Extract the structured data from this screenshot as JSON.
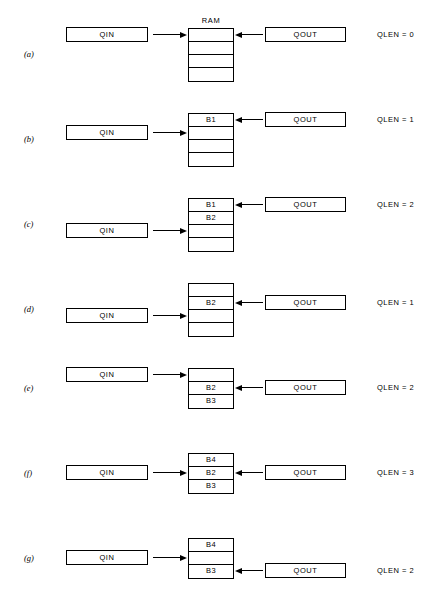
{
  "figure": {
    "ram_title": "RAM",
    "qin_label": "QIN",
    "qout_label": "QOUT",
    "rows": [
      {
        "label": "(a)",
        "cells": [
          "",
          "",
          "",
          ""
        ],
        "qin_target_cell": 0,
        "qout_target_cell": 0,
        "qlen_text": "QLEN = 0",
        "show_ram_title": true
      },
      {
        "label": "(b)",
        "cells": [
          "B1",
          "",
          "",
          ""
        ],
        "qin_target_cell": 1,
        "qout_target_cell": 0,
        "qlen_text": "QLEN = 1",
        "show_ram_title": false
      },
      {
        "label": "(c)",
        "cells": [
          "B1",
          "B2",
          "",
          ""
        ],
        "qin_target_cell": 2,
        "qout_target_cell": 0,
        "qlen_text": "QLEN = 2",
        "show_ram_title": false
      },
      {
        "label": "(d)",
        "cells": [
          "",
          "B2",
          "",
          ""
        ],
        "qin_target_cell": 2,
        "qout_target_cell": 1,
        "qlen_text": "QLEN = 1",
        "show_ram_title": false
      },
      {
        "label": "(e)",
        "cells": [
          "",
          "B2",
          "B3"
        ],
        "qin_target_cell": 0,
        "qout_target_cell": 1,
        "qlen_text": "QLEN = 2",
        "show_ram_title": false
      },
      {
        "label": "(f)",
        "cells": [
          "B4",
          "B2",
          "B3"
        ],
        "qin_target_cell": 1,
        "qout_target_cell": 1,
        "qlen_text": "QLEN = 3",
        "show_ram_title": false
      },
      {
        "label": "(g)",
        "cells": [
          "B4",
          "",
          "B3"
        ],
        "qin_target_cell": 1,
        "qout_target_cell": 2,
        "qlen_text": "QLEN = 2",
        "show_ram_title": false
      }
    ]
  },
  "layout": {
    "row_tops": [
      0,
      85,
      170,
      255,
      340,
      425,
      510
    ],
    "ram_top_in_row": 28,
    "cell_height": 13
  },
  "colors": {
    "ink": "#000000",
    "paper": "#ffffff"
  }
}
